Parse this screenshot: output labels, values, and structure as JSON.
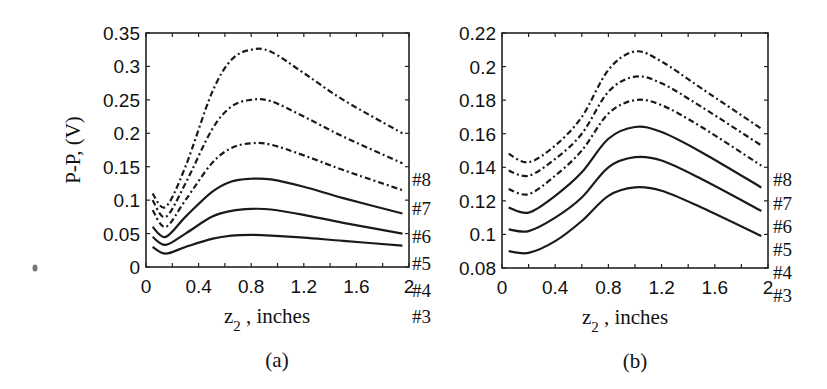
{
  "chart_data": [
    {
      "panel": "(a)",
      "type": "line",
      "title": "",
      "caption": "(a)",
      "xlabel": "z2 , inches",
      "ylabel": "P-P, (V)",
      "xlim": [
        0,
        2
      ],
      "ylim": [
        0,
        0.35
      ],
      "xticks": [
        "0",
        "0.4",
        "0.8",
        "1.2",
        "1.6",
        "2"
      ],
      "yticks": [
        "0",
        "0.05",
        "0.1",
        "0.15",
        "0.2",
        "0.25",
        "0.3",
        "0.35"
      ],
      "grid": false,
      "legend_position": "right end labels",
      "x": [
        0.05,
        0.15,
        0.3,
        0.5,
        0.65,
        0.8,
        0.95,
        1.2,
        1.5,
        1.95
      ],
      "series": [
        {
          "name": "#8",
          "style": "dash-dot",
          "values": [
            0.11,
            0.09,
            0.15,
            0.26,
            0.31,
            0.325,
            0.322,
            0.29,
            0.25,
            0.2
          ]
        },
        {
          "name": "#7",
          "style": "dash-dot",
          "values": [
            0.1,
            0.075,
            0.125,
            0.205,
            0.24,
            0.25,
            0.248,
            0.225,
            0.195,
            0.155
          ]
        },
        {
          "name": "#6",
          "style": "dash-dot",
          "values": [
            0.085,
            0.06,
            0.1,
            0.155,
            0.178,
            0.185,
            0.183,
            0.167,
            0.145,
            0.115
          ]
        },
        {
          "name": "#5",
          "style": "solid",
          "values": [
            0.06,
            0.045,
            0.075,
            0.112,
            0.128,
            0.132,
            0.131,
            0.12,
            0.103,
            0.08
          ]
        },
        {
          "name": "#4",
          "style": "solid",
          "values": [
            0.045,
            0.033,
            0.05,
            0.075,
            0.084,
            0.087,
            0.086,
            0.078,
            0.066,
            0.05
          ]
        },
        {
          "name": "#3",
          "style": "solid",
          "values": [
            0.03,
            0.02,
            0.03,
            0.042,
            0.047,
            0.048,
            0.047,
            0.044,
            0.039,
            0.032
          ]
        }
      ]
    },
    {
      "panel": "(b)",
      "type": "line",
      "title": "",
      "caption": "(b)",
      "xlabel": "z2 , inches",
      "ylabel": "",
      "xlim": [
        0,
        2
      ],
      "ylim": [
        0.08,
        0.22
      ],
      "xticks": [
        "0",
        "0.4",
        "0.8",
        "1.2",
        "1.6",
        "2"
      ],
      "yticks": [
        "0.08",
        "0.1",
        "0.12",
        "0.14",
        "0.16",
        "0.18",
        "0.2",
        "0.22"
      ],
      "grid": false,
      "legend_position": "right end labels",
      "x": [
        0.05,
        0.2,
        0.4,
        0.6,
        0.8,
        1.0,
        1.2,
        1.5,
        1.95
      ],
      "series": [
        {
          "name": "#8",
          "style": "dash-dot",
          "values": [
            0.148,
            0.143,
            0.153,
            0.17,
            0.198,
            0.209,
            0.203,
            0.187,
            0.163
          ]
        },
        {
          "name": "#7",
          "style": "dash-dot",
          "values": [
            0.138,
            0.135,
            0.145,
            0.16,
            0.185,
            0.194,
            0.19,
            0.176,
            0.153
          ]
        },
        {
          "name": "#6",
          "style": "dash-dot",
          "values": [
            0.127,
            0.124,
            0.135,
            0.15,
            0.172,
            0.18,
            0.177,
            0.164,
            0.141
          ]
        },
        {
          "name": "#5",
          "style": "solid",
          "values": [
            0.116,
            0.113,
            0.123,
            0.137,
            0.157,
            0.164,
            0.161,
            0.149,
            0.128
          ]
        },
        {
          "name": "#4",
          "style": "solid",
          "values": [
            0.103,
            0.102,
            0.11,
            0.122,
            0.14,
            0.146,
            0.144,
            0.133,
            0.114
          ]
        },
        {
          "name": "#3",
          "style": "solid",
          "values": [
            0.09,
            0.089,
            0.096,
            0.108,
            0.123,
            0.128,
            0.126,
            0.116,
            0.099
          ]
        }
      ]
    }
  ]
}
